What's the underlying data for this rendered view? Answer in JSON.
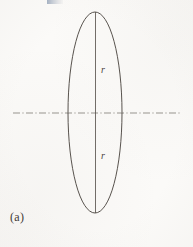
{
  "figure": {
    "caption": "(a)",
    "background_color": "#fbfaf8",
    "stroke_color": "#4f4a45",
    "label_color": "#4a4440",
    "width": 193,
    "height": 247
  },
  "labels": {
    "radius_upper": "r",
    "radius_lower": "r"
  },
  "geometry": {
    "ellipse": {
      "center_x": 95,
      "center_y": 112.5,
      "radius_x": 27,
      "radius_y": 100.5
    },
    "vertical_axis": {
      "x": 95.5,
      "y_top": 12,
      "y_bottom": 213
    },
    "center_line": {
      "y": 113,
      "x_start": 13,
      "x_end": 180,
      "style": "dash-dot"
    }
  }
}
